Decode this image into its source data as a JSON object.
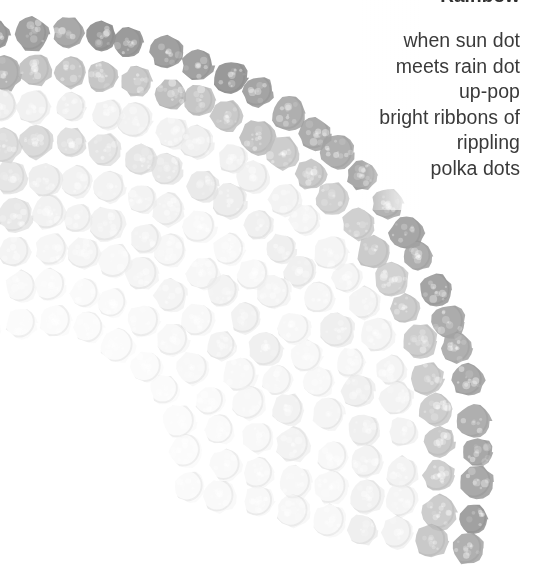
{
  "page": {
    "background_color": "#ffffff",
    "width": 538,
    "height": 588
  },
  "title": {
    "text": "Rainbow",
    "note": "clipped at top edge of page",
    "color": "#2f2f2f"
  },
  "poem": {
    "alignment": "right",
    "color": "#3a3a3a",
    "lines": [
      "when sun dot",
      "meets rain dot",
      "up-pop",
      "bright ribbons of",
      "rippling",
      "polka dots"
    ]
  },
  "artwork": {
    "name": "rainbow-dots-illustration",
    "description": "Grayscale rainbow drawn as concentric arcs of hand-stamped polka dots",
    "arc_center_x": 40,
    "arc_center_y": 470,
    "dot_diameter": 33,
    "bands": [
      {
        "index": 0,
        "radius": 436,
        "color": "#8e8e8e",
        "opacity": 0.95
      },
      {
        "index": 1,
        "radius": 400,
        "color": "#9c9c9c",
        "opacity": 0.92
      },
      {
        "index": 2,
        "radius": 364,
        "color": "#e2e2e2",
        "opacity": 0.85
      },
      {
        "index": 3,
        "radius": 328,
        "color": "#a8a8a8",
        "opacity": 0.9
      },
      {
        "index": 4,
        "radius": 292,
        "color": "#b6b6b6",
        "opacity": 0.85
      },
      {
        "index": 5,
        "radius": 256,
        "color": "#8a8a8a",
        "opacity": 0.92
      },
      {
        "index": 6,
        "radius": 220,
        "color": "#9a9a9a",
        "opacity": 0.9
      },
      {
        "index": 7,
        "radius": 184,
        "color": "#d8d8d8",
        "opacity": 0.75
      },
      {
        "index": 8,
        "radius": 148,
        "color": "#ececec",
        "opacity": 0.6
      }
    ],
    "fade": {
      "description": "dots fade toward near-white on the inner bands and lower-middle of the arc",
      "lightest_color": "#f4f4f4",
      "darkest_color": "#7a7a7a"
    }
  }
}
